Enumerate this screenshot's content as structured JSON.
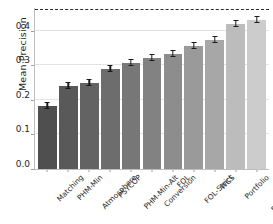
{
  "chart_data": {
    "type": "bar",
    "title": "",
    "xlabel": "",
    "ylabel": "Mean Precision",
    "ylim": [
      0.0,
      0.465
    ],
    "yticks": [
      "0.0",
      "0.1",
      "0.2",
      "0.3",
      "0.4"
    ],
    "ytick_values": [
      0.0,
      0.1,
      0.2,
      0.3,
      0.4
    ],
    "grid": true,
    "legend": "none",
    "categories": [
      "Matching",
      "PHM-Min",
      "Atmosphere",
      "PSYCOP",
      "PHM-Min-Alt",
      "Conversion",
      "FOL",
      "FOL-Strict",
      "WCS",
      "Portfolio",
      "Portfolio-Max"
    ],
    "values": [
      0.183,
      0.24,
      0.248,
      0.29,
      0.306,
      0.32,
      0.332,
      0.356,
      0.372,
      0.42,
      0.43
    ],
    "errors": [
      0.004,
      0.004,
      0.004,
      0.004,
      0.004,
      0.004,
      0.004,
      0.004,
      0.004,
      0.005,
      0.005
    ],
    "bar_colors": [
      "#4f4f4f",
      "#595959",
      "#636363",
      "#6d6d6d",
      "#777777",
      "#828282",
      "#8d8d8d",
      "#9a9a9a",
      "#a7a7a7",
      "#bcbcbc",
      "#cccccc"
    ],
    "reference_line": {
      "value": 0.458,
      "style": "dashed",
      "color": "#2a2a2a"
    },
    "axis_color": "#bdbdbd",
    "grid_color": "#e3e3e3",
    "error_bar_color": "#1a1a1a"
  }
}
